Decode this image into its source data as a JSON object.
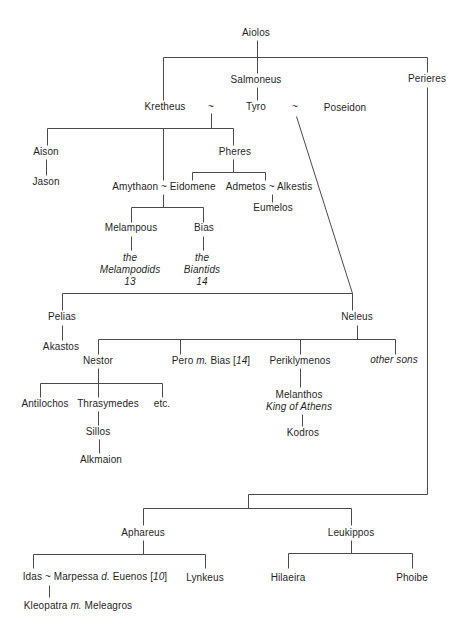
{
  "diagram": {
    "type": "family-tree",
    "background_color": "#ffffff",
    "line_color": "#4a4a4a",
    "text_color": "#1f1f1f",
    "nodes": [
      {
        "id": "aiolos",
        "lines": [
          [
            {
              "text": "Aiolos",
              "italic": false
            }
          ]
        ]
      },
      {
        "id": "salmoneus",
        "lines": [
          [
            {
              "text": "Salmoneus",
              "italic": false
            }
          ]
        ]
      },
      {
        "id": "perieres",
        "lines": [
          [
            {
              "text": "Perieres",
              "italic": false
            }
          ]
        ]
      },
      {
        "id": "kretheus",
        "lines": [
          [
            {
              "text": "Kretheus",
              "italic": false
            }
          ]
        ]
      },
      {
        "id": "tilde-kretheus-tyro",
        "lines": [
          [
            {
              "text": "~",
              "italic": false
            }
          ]
        ]
      },
      {
        "id": "tyro",
        "lines": [
          [
            {
              "text": "Tyro",
              "italic": false
            }
          ]
        ]
      },
      {
        "id": "tilde-tyro-poseidon",
        "lines": [
          [
            {
              "text": "~",
              "italic": false
            }
          ]
        ]
      },
      {
        "id": "poseidon",
        "lines": [
          [
            {
              "text": "Poseidon",
              "italic": false
            }
          ]
        ]
      },
      {
        "id": "aison",
        "lines": [
          [
            {
              "text": "Aison",
              "italic": false
            }
          ]
        ]
      },
      {
        "id": "jason",
        "lines": [
          [
            {
              "text": "Jason",
              "italic": false
            }
          ]
        ]
      },
      {
        "id": "pheres",
        "lines": [
          [
            {
              "text": "Pheres",
              "italic": false
            }
          ]
        ]
      },
      {
        "id": "amythaon-eidomene",
        "lines": [
          [
            {
              "text": "Amythaon ~ Eidomene",
              "italic": false
            }
          ]
        ]
      },
      {
        "id": "admetos-alkestis",
        "lines": [
          [
            {
              "text": "Admetos ~ Alkestis",
              "italic": false
            }
          ]
        ]
      },
      {
        "id": "eumelos",
        "lines": [
          [
            {
              "text": "Eumelos",
              "italic": false
            }
          ]
        ]
      },
      {
        "id": "melampous",
        "lines": [
          [
            {
              "text": "Melampous",
              "italic": false
            }
          ]
        ]
      },
      {
        "id": "bias",
        "lines": [
          [
            {
              "text": "Bias",
              "italic": false
            }
          ]
        ]
      },
      {
        "id": "melampodids",
        "lines": [
          [
            {
              "text": "the",
              "italic": true
            }
          ],
          [
            {
              "text": "Melampodids",
              "italic": true
            }
          ],
          [
            {
              "text": "13",
              "italic": true
            }
          ]
        ]
      },
      {
        "id": "biantids",
        "lines": [
          [
            {
              "text": "the",
              "italic": true
            }
          ],
          [
            {
              "text": "Biantids",
              "italic": true
            }
          ],
          [
            {
              "text": "14",
              "italic": true
            }
          ]
        ]
      },
      {
        "id": "pelias",
        "lines": [
          [
            {
              "text": "Pelias",
              "italic": false
            }
          ]
        ]
      },
      {
        "id": "akastos",
        "lines": [
          [
            {
              "text": "Akastos",
              "italic": false
            }
          ]
        ]
      },
      {
        "id": "neleus",
        "lines": [
          [
            {
              "text": "Neleus",
              "italic": false
            }
          ]
        ]
      },
      {
        "id": "nestor",
        "lines": [
          [
            {
              "text": "Nestor",
              "italic": false
            }
          ]
        ]
      },
      {
        "id": "pero-bias",
        "lines": [
          [
            {
              "text": "Pero ",
              "italic": false
            },
            {
              "text": "m.",
              "italic": true
            },
            {
              "text": " Bias [",
              "italic": false
            },
            {
              "text": "14",
              "italic": true
            },
            {
              "text": "]",
              "italic": false
            }
          ]
        ]
      },
      {
        "id": "periklymenos",
        "lines": [
          [
            {
              "text": "Periklymenos",
              "italic": false
            }
          ]
        ]
      },
      {
        "id": "other-sons",
        "lines": [
          [
            {
              "text": "other sons",
              "italic": true
            }
          ]
        ]
      },
      {
        "id": "antilochos",
        "lines": [
          [
            {
              "text": "Antilochos",
              "italic": false
            }
          ]
        ]
      },
      {
        "id": "thrasymedes",
        "lines": [
          [
            {
              "text": "Thrasymedes",
              "italic": false
            }
          ]
        ]
      },
      {
        "id": "etc",
        "lines": [
          [
            {
              "text": "etc.",
              "italic": false
            }
          ]
        ]
      },
      {
        "id": "sillos",
        "lines": [
          [
            {
              "text": "Sillos",
              "italic": false
            }
          ]
        ]
      },
      {
        "id": "alkmaion",
        "lines": [
          [
            {
              "text": "Alkmaion",
              "italic": false
            }
          ]
        ]
      },
      {
        "id": "melanthos",
        "lines": [
          [
            {
              "text": "Melanthos",
              "italic": false
            }
          ],
          [
            {
              "text": "King of Athens",
              "italic": true
            }
          ]
        ]
      },
      {
        "id": "kodros",
        "lines": [
          [
            {
              "text": "Kodros",
              "italic": false
            }
          ]
        ]
      },
      {
        "id": "aphareus",
        "lines": [
          [
            {
              "text": "Aphareus",
              "italic": false
            }
          ]
        ]
      },
      {
        "id": "leukippos",
        "lines": [
          [
            {
              "text": "Leukippos",
              "italic": false
            }
          ]
        ]
      },
      {
        "id": "idas-marpessa",
        "lines": [
          [
            {
              "text": "Idas ~ Marpessa ",
              "italic": false
            },
            {
              "text": "d.",
              "italic": true
            },
            {
              "text": " Euenos [",
              "italic": false
            },
            {
              "text": "10",
              "italic": true
            },
            {
              "text": "]",
              "italic": false
            }
          ]
        ]
      },
      {
        "id": "lynkeus",
        "lines": [
          [
            {
              "text": "Lynkeus",
              "italic": false
            }
          ]
        ]
      },
      {
        "id": "hilaeira",
        "lines": [
          [
            {
              "text": "Hilaeira",
              "italic": false
            }
          ]
        ]
      },
      {
        "id": "phoibe",
        "lines": [
          [
            {
              "text": "Phoibe",
              "italic": false
            }
          ]
        ]
      },
      {
        "id": "kleopatra-meleagros",
        "lines": [
          [
            {
              "text": "Kleopatra ",
              "italic": false
            },
            {
              "text": "m.",
              "italic": true
            },
            {
              "text": " Meleagros",
              "italic": false
            }
          ]
        ]
      }
    ]
  }
}
